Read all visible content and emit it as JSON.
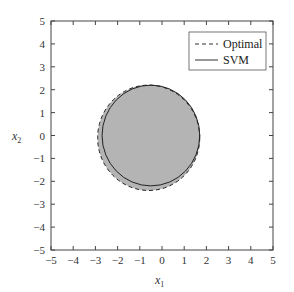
{
  "chart_data": {
    "type": "area",
    "title": "",
    "xlabel": "x1",
    "ylabel": "x2",
    "xlim": [
      -5,
      5
    ],
    "ylim": [
      -5,
      5
    ],
    "xticks": [
      -5,
      -4,
      -3,
      -2,
      -1,
      0,
      1,
      2,
      3,
      4,
      5
    ],
    "yticks": [
      -5,
      -4,
      -3,
      -2,
      -1,
      0,
      1,
      2,
      3,
      4,
      5
    ],
    "grid": false,
    "legend_position": "upper right",
    "series": [
      {
        "name": "Optimal",
        "style": "dashed",
        "shape": "circle",
        "center": [
          -0.6,
          -0.1
        ],
        "radius": 2.3
      },
      {
        "name": "SVM",
        "style": "solid",
        "shape": "circle",
        "center": [
          -0.5,
          0.0
        ],
        "radius": 2.2
      }
    ],
    "fill": {
      "region": "inside boundary",
      "color": "#b4b4b4"
    }
  },
  "legend": {
    "items": [
      {
        "label": "Optimal",
        "style": "dashed"
      },
      {
        "label": "SVM",
        "style": "solid"
      }
    ]
  },
  "axes": {
    "xlabel_main": "x",
    "xlabel_sub": "1",
    "ylabel_main": "x",
    "ylabel_sub": "2"
  }
}
